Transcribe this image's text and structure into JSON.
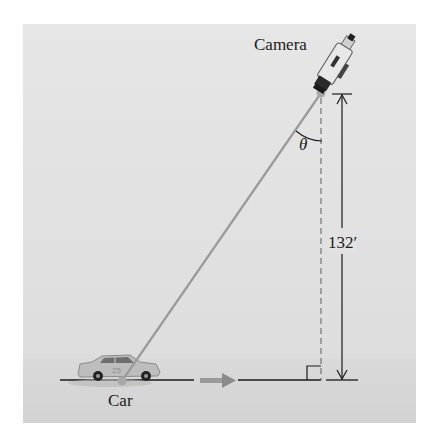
{
  "figure": {
    "labels": {
      "camera": "Camera",
      "car": "Car",
      "height": "132′",
      "angle": "θ"
    },
    "elements": {
      "camera_icon": "camcorder-icon",
      "car_icon": "race-car-icon",
      "direction_arrow": "right-arrow-icon",
      "right_angle_marker": "right-angle-icon"
    },
    "colors": {
      "background": "#e2e2e2",
      "sight_line": "#9a9a9a",
      "lines": "#1a1a1a",
      "arrow": "#8c8c8c"
    },
    "measurements": {
      "camera_height_ft": 132,
      "angle_symbol": "θ"
    }
  }
}
